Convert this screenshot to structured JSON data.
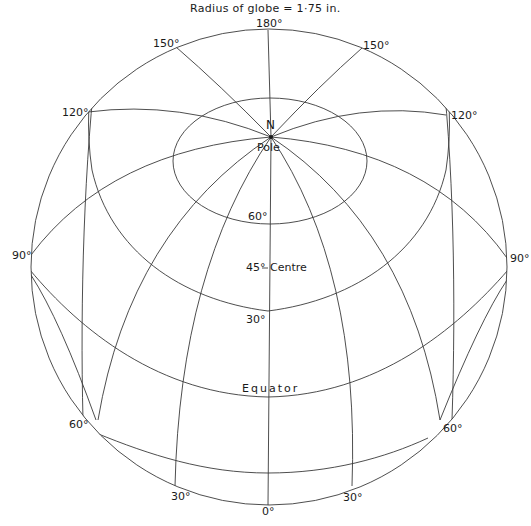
{
  "title": "Radius of globe = 1·75 in.",
  "caption": "Fig. 14 (continued: orthographic-style net)",
  "labels": {
    "meridian_top": "180°",
    "meridian_150_left": "150°",
    "meridian_150_right": "150°",
    "meridian_120_left": "120°",
    "meridian_120_right": "120°",
    "meridian_90_left": "90°",
    "meridian_90_right": "90°",
    "meridian_60_left": "60°",
    "meridian_60_right": "60°",
    "meridian_30_left": "30°",
    "meridian_30_right": "30°",
    "meridian_bottom": "0°",
    "pole_n": "N",
    "pole": "Pole",
    "lat_60": "60°",
    "centre_lat": "45°",
    "centre": "Centre",
    "lat_30": "30°",
    "equator": "Equator"
  },
  "colors": {
    "line": "#3a3a3a",
    "text": "#1a1a1a",
    "background": "#ffffff"
  }
}
